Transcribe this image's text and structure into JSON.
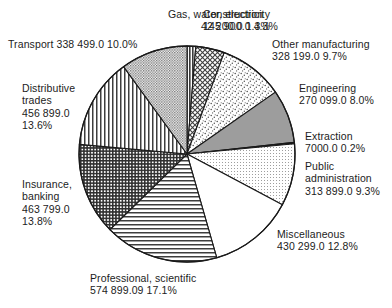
{
  "chart_data": {
    "type": "pie",
    "title": "",
    "subtitle": "",
    "xlabel": "",
    "ylabel": "",
    "legend_position": "none",
    "grid": false,
    "start_angle_deg": 0,
    "direction": "clockwise",
    "value_unit": "",
    "categories": [
      "Gas, water, electricity",
      "Construction",
      "Other manufacturing",
      "Engineering",
      "Extraction",
      "Public administration",
      "Miscellaneous",
      "Professional, scientific",
      "Insurance, banking",
      "Distributive trades",
      "Transport"
    ],
    "values": [
      42200.0,
      145900.0,
      328199.0,
      270099.0,
      7000.0,
      313899.0,
      430299.0,
      574899.09,
      463799.0,
      456899.0,
      338499.0
    ],
    "percentages": [
      1.3,
      4.3,
      9.7,
      8.0,
      0.2,
      9.3,
      12.8,
      17.1,
      13.8,
      13.6,
      10.0
    ],
    "slices": [
      {
        "key": "gas",
        "name": "Gas, water, electricity",
        "value_text": "42 200.0",
        "percent_text": "1.3%",
        "value": 42200.0,
        "percent": 1.3,
        "fill": "dark-vertical-stripe",
        "fill_color": "#4a4a4a"
      },
      {
        "key": "construction",
        "name": "Construction",
        "value_text": "145 900.0",
        "percent_text": "4.3%",
        "value": 145900.0,
        "percent": 4.3,
        "fill": "cross-hatch",
        "fill_color": "#777777"
      },
      {
        "key": "other-manufacturing",
        "name": "Other manufacturing",
        "value_text": "328 199.0",
        "percent_text": "9.7%",
        "value": 328199.0,
        "percent": 9.7,
        "fill": "coarse-stipple",
        "fill_color": "#9a9a9a"
      },
      {
        "key": "engineering",
        "name": "Engineering",
        "value_text": "270 099.0",
        "percent_text": "8.0%",
        "value": 270099.0,
        "percent": 8.0,
        "fill": "solid-gray",
        "fill_color": "#9d9d9d"
      },
      {
        "key": "extraction",
        "name": "Extraction",
        "value_text": "7000.0",
        "percent_text": "0.2%",
        "value": 7000.0,
        "percent": 0.2,
        "fill": "solid-black",
        "fill_color": "#111111"
      },
      {
        "key": "public-administration",
        "name": "Public administration",
        "value_text": "313 899.0",
        "percent_text": "9.3%",
        "value": 313899.0,
        "percent": 9.3,
        "fill": "fine-dot-grid",
        "fill_color": "#c9c9c9"
      },
      {
        "key": "miscellaneous",
        "name": "Miscellaneous",
        "value_text": "430 299.0",
        "percent_text": "12.8%",
        "value": 430299.0,
        "percent": 12.8,
        "fill": "blank-white",
        "fill_color": "#ffffff"
      },
      {
        "key": "professional-scientific",
        "name": "Professional, scientific",
        "value_text": "574 899.09",
        "percent_text": "17.1%",
        "value": 574899.09,
        "percent": 17.1,
        "fill": "horizontal-lines",
        "fill_color": "#888888"
      },
      {
        "key": "insurance-banking",
        "name": "Insurance, banking",
        "value_text": "463 799.0",
        "percent_text": "13.8%",
        "value": 463799.0,
        "percent": 13.8,
        "fill": "dense-cross-grid",
        "fill_color": "#5e5e5e"
      },
      {
        "key": "distributive-trades",
        "name": "Distributive trades",
        "value_text": "456 899.0",
        "percent_text": "13.6%",
        "value": 456899.0,
        "percent": 13.6,
        "fill": "vertical-lines",
        "fill_color": "#8a8a8a"
      },
      {
        "key": "transport",
        "name": "Transport",
        "value_text": "338 499.0",
        "percent_text": "10.0%",
        "value": 338499.0,
        "percent": 10.0,
        "fill": "medium-dot-texture",
        "fill_color": "#b0b0b0"
      }
    ]
  },
  "labels": {
    "gas": "Gas, water, electricity\n42 200.0 1.3%",
    "construction": "Construction\n145 900.0 4.3%",
    "transport": "Transport  338 499.0 10.0%",
    "other_manufacturing": "Other manufacturing\n328 199.0 9.7%",
    "distributive_trades": "Distributive\ntrades\n456 899.0\n13.6%",
    "engineering": "Engineering\n270 099.0 8.0%",
    "extraction": "Extraction\n7000.0 0.2%",
    "public_administration": "Public\nadministration\n313 899.0 9.3%",
    "insurance_banking": "Insurance,\nbanking\n463 799.0\n13.8%",
    "miscellaneous": "Miscellaneous\n430 299.0 12.8%",
    "professional_scientific": "Professional, scientific\n574 899.09 17.1%"
  },
  "colors": {
    "outline": "#1a1a1a",
    "text": "#1c1c1c",
    "background": "#ffffff"
  }
}
